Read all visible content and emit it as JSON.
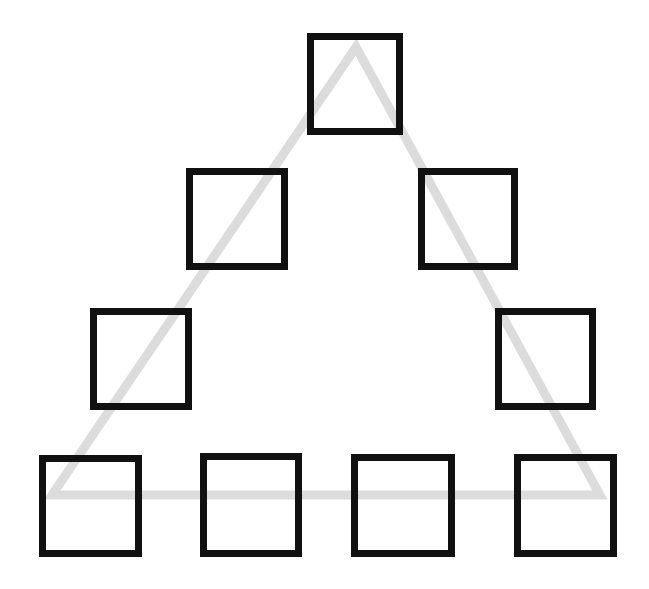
{
  "figure": {
    "canvas": {
      "width": 649,
      "height": 589,
      "background_color": "#ffffff"
    },
    "shapes_summary": {
      "square_count": 9,
      "triangle_count": 1,
      "square_color": "#111111",
      "square_border_width": 7,
      "triangle_color": "#dcdcdc",
      "triangle_stroke_width": 9
    },
    "rows": [
      {
        "row_label": "row-1-apex",
        "square_count": 1
      },
      {
        "row_label": "row-2",
        "square_count": 2
      },
      {
        "row_label": "row-3",
        "square_count": 2
      },
      {
        "row_label": "row-4-base",
        "square_count": 4
      }
    ],
    "squares": [
      {
        "name": "square-row1-center",
        "row": 1,
        "index": 0,
        "x": 307,
        "y": 33,
        "width": 96,
        "height": 102,
        "color": "#111111",
        "border_width": 7
      },
      {
        "name": "square-row2-left",
        "row": 2,
        "index": 0,
        "x": 186,
        "y": 168,
        "width": 102,
        "height": 102,
        "color": "#111111",
        "border_width": 7
      },
      {
        "name": "square-row2-right",
        "row": 2,
        "index": 1,
        "x": 418,
        "y": 168,
        "width": 100,
        "height": 102,
        "color": "#111111",
        "border_width": 7
      },
      {
        "name": "square-row3-left",
        "row": 3,
        "index": 0,
        "x": 90,
        "y": 308,
        "width": 102,
        "height": 102,
        "color": "#111111",
        "border_width": 7
      },
      {
        "name": "square-row3-right",
        "row": 3,
        "index": 1,
        "x": 495,
        "y": 308,
        "width": 101,
        "height": 102,
        "color": "#111111",
        "border_width": 7
      },
      {
        "name": "square-row4-1",
        "row": 4,
        "index": 0,
        "x": 39,
        "y": 455,
        "width": 103,
        "height": 102,
        "color": "#111111",
        "border_width": 7
      },
      {
        "name": "square-row4-2",
        "row": 4,
        "index": 1,
        "x": 200,
        "y": 453,
        "width": 102,
        "height": 104,
        "color": "#111111",
        "border_width": 7
      },
      {
        "name": "square-row4-3",
        "row": 4,
        "index": 2,
        "x": 351,
        "y": 454,
        "width": 104,
        "height": 103,
        "color": "#111111",
        "border_width": 7
      },
      {
        "name": "square-row4-4",
        "row": 4,
        "index": 3,
        "x": 514,
        "y": 454,
        "width": 103,
        "height": 103,
        "color": "#111111",
        "border_width": 7
      }
    ],
    "triangle": {
      "name": "background-triangle",
      "apex": {
        "x": 356,
        "y": 47
      },
      "bottom_left": {
        "x": 52,
        "y": 495
      },
      "bottom_right": {
        "x": 600,
        "y": 495
      },
      "points": "356,47 600,495 52,495",
      "stroke_color": "#dcdcdc",
      "stroke_width": 9,
      "fill": "none"
    }
  }
}
